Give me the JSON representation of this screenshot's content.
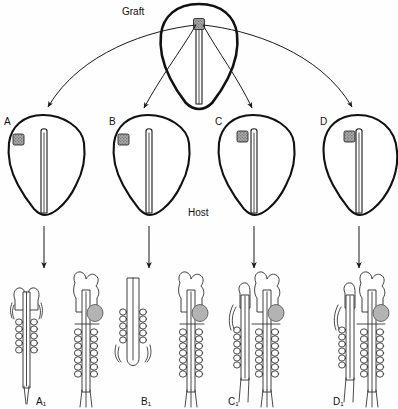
{
  "figure": {
    "title_graft": "Graft",
    "title_host": "Host",
    "background_color": "#fefefe",
    "ink_color": "#111111",
    "graft_marker_color": "#9a9a9a",
    "vesicle_color": "#b3b3b3"
  },
  "donor": {
    "label": "Graft",
    "graft_marker_name": "graft-tissue-square"
  },
  "hosts": [
    {
      "id": "A",
      "label": "A",
      "graft_position": "far-lateral",
      "result_label": "A₁",
      "result_sub": "1",
      "result_description": "separate complete secondary embryo"
    },
    {
      "id": "B",
      "label": "B",
      "graft_position": "lateral",
      "result_label": "B₁",
      "result_sub": "1",
      "result_description": "secondary neural tube with somites, no head"
    },
    {
      "id": "C",
      "label": "C",
      "graft_position": "near-tube",
      "result_label": "C₁",
      "result_sub": "1",
      "result_description": "secondary embryo partially fused to host"
    },
    {
      "id": "D",
      "label": "D",
      "graft_position": "adjacent-tube",
      "result_label": "D₁",
      "result_sub": "1",
      "result_description": "secondary embryo closely fused to host"
    }
  ],
  "results": [
    {
      "key": "A1",
      "label": "A₁"
    },
    {
      "key": "B1",
      "label": "B₁"
    },
    {
      "key": "C1",
      "label": "C₁"
    },
    {
      "key": "D1",
      "label": "D₁"
    }
  ],
  "arrows": {
    "transplant_arrow_name": "transplant-arrow",
    "development_arrow_name": "development-arrow",
    "count_transplant": 4,
    "count_development": 4
  }
}
